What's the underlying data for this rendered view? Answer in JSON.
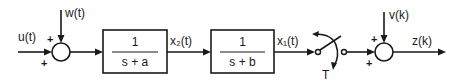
{
  "diagram": {
    "type": "block-diagram",
    "colors": {
      "stroke": "#1a1a1a",
      "background": "#ffffff"
    },
    "signals": {
      "input": "u(t)",
      "process_noise": "w(t)",
      "state_2": "x₂(t)",
      "state_1": "x₁(t)",
      "measurement_noise": "v(k)",
      "output": "z(k)"
    },
    "blocks": [
      {
        "id": "block-1",
        "numerator": "1",
        "denominator": "s + a"
      },
      {
        "id": "block-2",
        "numerator": "1",
        "denominator": "s + b"
      }
    ],
    "summing_junctions": [
      {
        "id": "sum-1",
        "signs": {
          "left": "+",
          "top": "+"
        }
      },
      {
        "id": "sum-2",
        "signs": {
          "left": "+",
          "top": "+"
        }
      }
    ],
    "sampler": {
      "label": "T"
    }
  }
}
